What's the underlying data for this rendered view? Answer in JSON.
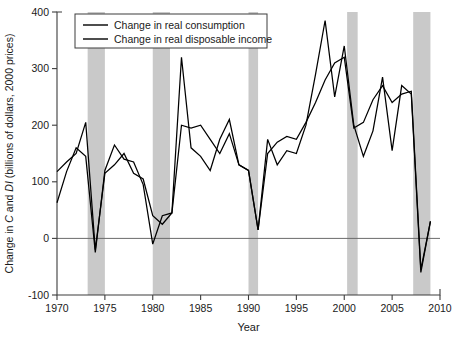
{
  "chart_data": {
    "type": "line",
    "title": "",
    "xlabel": "Year",
    "ylabel": "Change in C and DI (billions of dollars, 2000 prices)",
    "ylabel_parts": [
      {
        "text": "Change in ",
        "italic": false
      },
      {
        "text": "C",
        "italic": true
      },
      {
        "text": " and ",
        "italic": false
      },
      {
        "text": "DI",
        "italic": true
      },
      {
        "text": " (billions of dollars, 2000 prices)",
        "italic": false
      }
    ],
    "xlim": [
      1970,
      2010
    ],
    "ylim": [
      -100,
      400
    ],
    "xticks": [
      1970,
      1975,
      1980,
      1985,
      1990,
      1995,
      2000,
      2005,
      2010
    ],
    "yticks": [
      -100,
      0,
      100,
      200,
      300,
      400
    ],
    "grid": false,
    "zero_line": 0,
    "legend_position": "top-left",
    "legend": [
      "Change in real consumption",
      "Change in real disposable income"
    ],
    "x": [
      1970,
      1971,
      1972,
      1973,
      1974,
      1975,
      1976,
      1977,
      1978,
      1979,
      1980,
      1981,
      1982,
      1983,
      1984,
      1985,
      1986,
      1987,
      1988,
      1989,
      1990,
      1991,
      1992,
      1993,
      1994,
      1995,
      1996,
      1997,
      1998,
      1999,
      2000,
      2001,
      2002,
      2003,
      2004,
      2005,
      2006,
      2007,
      2008,
      2009
    ],
    "series": [
      {
        "name": "Change in real consumption",
        "color": "#000000",
        "values": [
          63,
          118,
          160,
          145,
          -25,
          120,
          165,
          140,
          135,
          95,
          -10,
          40,
          45,
          200,
          195,
          200,
          175,
          150,
          185,
          130,
          120,
          15,
          150,
          170,
          180,
          175,
          205,
          240,
          280,
          310,
          320,
          195,
          205,
          245,
          270,
          240,
          255,
          260,
          -55,
          30
        ]
      },
      {
        "name": "Change in real disposable income",
        "color": "#000000",
        "values": [
          118,
          135,
          150,
          205,
          -20,
          115,
          130,
          150,
          115,
          105,
          40,
          25,
          45,
          320,
          160,
          145,
          120,
          175,
          210,
          130,
          120,
          15,
          175,
          130,
          155,
          150,
          200,
          290,
          385,
          250,
          340,
          200,
          145,
          190,
          285,
          155,
          270,
          255,
          -60,
          30
        ]
      }
    ],
    "recession_bands": [
      {
        "start": 1973.2,
        "end": 1975.0
      },
      {
        "start": 1980.0,
        "end": 1981.8
      },
      {
        "start": 1990.0,
        "end": 1991.0
      },
      {
        "start": 2000.3,
        "end": 2001.4
      },
      {
        "start": 2007.2,
        "end": 2009.0
      }
    ]
  }
}
